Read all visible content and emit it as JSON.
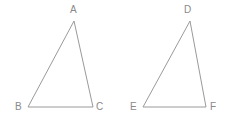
{
  "figure": {
    "type": "geometry-diagram",
    "background_color": "#ffffff",
    "stroke_color": "#9a9a9a",
    "label_color": "#8a8a8a",
    "stroke_width": 1,
    "width": 227,
    "height": 124,
    "shapes": [
      {
        "name": "triangle-abc",
        "vertices": [
          {
            "label": "A",
            "x": 74,
            "y": 21,
            "label_x": 70,
            "label_y": 5
          },
          {
            "label": "B",
            "x": 28,
            "y": 107,
            "label_x": 15,
            "label_y": 102
          },
          {
            "label": "C",
            "x": 93,
            "y": 107,
            "label_x": 96,
            "label_y": 102
          }
        ]
      },
      {
        "name": "triangle-def",
        "vertices": [
          {
            "label": "D",
            "x": 190,
            "y": 21,
            "label_x": 184,
            "label_y": 5
          },
          {
            "label": "E",
            "x": 143,
            "y": 107,
            "label_x": 130,
            "label_y": 102
          },
          {
            "label": "F",
            "x": 206,
            "y": 107,
            "label_x": 210,
            "label_y": 102
          }
        ]
      }
    ]
  }
}
